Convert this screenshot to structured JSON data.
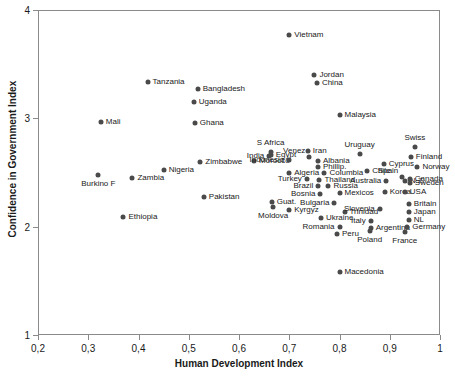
{
  "chart_data": {
    "type": "scatter",
    "title": "",
    "xlabel": "Human Development Index",
    "ylabel": "Confidence in Government Index",
    "xlim": [
      0.2,
      1.0
    ],
    "ylim": [
      1,
      4
    ],
    "xticks": [
      "0,2",
      "0,3",
      "0,4",
      "0,5",
      "0,6",
      "0,7",
      "0,8",
      "0,9",
      "1"
    ],
    "xtick_values": [
      0.2,
      0.3,
      0.4,
      0.5,
      0.6,
      0.7,
      0.8,
      0.9,
      1.0
    ],
    "yticks": [
      "1",
      "2",
      "3",
      "4"
    ],
    "ytick_values": [
      1,
      2,
      3,
      4
    ],
    "grid": false,
    "legend": "none",
    "marker_color": "#4a4a4a",
    "points": [
      {
        "label": "Vietnam",
        "x": 0.7,
        "y": 3.77,
        "side": "r"
      },
      {
        "label": "Jordan",
        "x": 0.75,
        "y": 3.4,
        "side": "r"
      },
      {
        "label": "China",
        "x": 0.755,
        "y": 3.33,
        "side": "r"
      },
      {
        "label": "Tanzania",
        "x": 0.418,
        "y": 3.34,
        "side": "r"
      },
      {
        "label": "Bangladesh",
        "x": 0.518,
        "y": 3.27,
        "side": "r"
      },
      {
        "label": "Uganda",
        "x": 0.51,
        "y": 3.15,
        "side": "r"
      },
      {
        "label": "Malaysia",
        "x": 0.8,
        "y": 3.03,
        "side": "r"
      },
      {
        "label": "Mali",
        "x": 0.325,
        "y": 2.97,
        "side": "r"
      },
      {
        "label": "Ghana",
        "x": 0.512,
        "y": 2.96,
        "side": "r"
      },
      {
        "label": "Swiss",
        "x": 0.95,
        "y": 2.74,
        "side": "c-up"
      },
      {
        "label": "S Africa",
        "x": 0.663,
        "y": 2.69,
        "side": "c-up"
      },
      {
        "label": "Iran",
        "x": 0.737,
        "y": 2.7,
        "side": "r"
      },
      {
        "label": "Uruguay",
        "x": 0.84,
        "y": 2.67,
        "side": "c-up"
      },
      {
        "label": "Egypt",
        "x": 0.663,
        "y": 2.66,
        "side": "r"
      },
      {
        "label": "India",
        "x": 0.66,
        "y": 2.65,
        "side": "l"
      },
      {
        "label": "Venez",
        "x": 0.74,
        "y": 2.64,
        "side": "l-up"
      },
      {
        "label": "Finland",
        "x": 0.942,
        "y": 2.64,
        "side": "r"
      },
      {
        "label": "Morocco",
        "x": 0.63,
        "y": 2.61,
        "side": "r"
      },
      {
        "label": "Indonesia",
        "x": 0.7,
        "y": 2.62,
        "side": "l"
      },
      {
        "label": "Albania",
        "x": 0.757,
        "y": 2.61,
        "side": "r"
      },
      {
        "label": "Zimbabwe",
        "x": 0.523,
        "y": 2.6,
        "side": "r"
      },
      {
        "label": "Cyprus",
        "x": 0.888,
        "y": 2.58,
        "side": "r"
      },
      {
        "label": "Phillip.",
        "x": 0.757,
        "y": 2.55,
        "side": "r"
      },
      {
        "label": "Norway",
        "x": 0.955,
        "y": 2.55,
        "side": "r"
      },
      {
        "label": "Nigeria",
        "x": 0.45,
        "y": 2.52,
        "side": "r"
      },
      {
        "label": "Algeria",
        "x": 0.7,
        "y": 2.5,
        "side": "r"
      },
      {
        "label": "Chile",
        "x": 0.855,
        "y": 2.51,
        "side": "r"
      },
      {
        "label": "Columbia",
        "x": 0.77,
        "y": 2.5,
        "side": "r"
      },
      {
        "label": "Burkino F",
        "x": 0.32,
        "y": 2.48,
        "side": "c-dn"
      },
      {
        "label": "Zambia",
        "x": 0.388,
        "y": 2.45,
        "side": "r"
      },
      {
        "label": "Spain",
        "x": 0.925,
        "y": 2.46,
        "side": "l-up"
      },
      {
        "label": "Turkey",
        "x": 0.735,
        "y": 2.44,
        "side": "l"
      },
      {
        "label": "Thailand",
        "x": 0.76,
        "y": 2.43,
        "side": "r"
      },
      {
        "label": "Australia",
        "x": 0.893,
        "y": 2.42,
        "side": "l"
      },
      {
        "label": "N.Z.",
        "x": 0.93,
        "y": 2.42,
        "side": "r"
      },
      {
        "label": "Canada",
        "x": 0.94,
        "y": 2.44,
        "side": "r"
      },
      {
        "label": "Sweden",
        "x": 0.94,
        "y": 2.4,
        "side": "r"
      },
      {
        "label": "Brazil",
        "x": 0.758,
        "y": 2.38,
        "side": "l"
      },
      {
        "label": "Russia",
        "x": 0.778,
        "y": 2.38,
        "side": "r"
      },
      {
        "label": "Mexicos",
        "x": 0.8,
        "y": 2.31,
        "side": "r"
      },
      {
        "label": "Korea",
        "x": 0.89,
        "y": 2.32,
        "side": "r"
      },
      {
        "label": "USA",
        "x": 0.93,
        "y": 2.32,
        "side": "r"
      },
      {
        "label": "Bosnia",
        "x": 0.762,
        "y": 2.3,
        "side": "l"
      },
      {
        "label": "Pakistan",
        "x": 0.53,
        "y": 2.27,
        "side": "r"
      },
      {
        "label": "Guat.",
        "x": 0.665,
        "y": 2.23,
        "side": "r"
      },
      {
        "label": "Bulgaria",
        "x": 0.79,
        "y": 2.22,
        "side": "l"
      },
      {
        "label": "Britain",
        "x": 0.938,
        "y": 2.21,
        "side": "r"
      },
      {
        "label": "Moldova",
        "x": 0.668,
        "y": 2.18,
        "side": "c-dn"
      },
      {
        "label": "Kyrgyz",
        "x": 0.7,
        "y": 2.15,
        "side": "r"
      },
      {
        "label": "Trinidad",
        "x": 0.81,
        "y": 2.14,
        "side": "r"
      },
      {
        "label": "Slovenia",
        "x": 0.88,
        "y": 2.16,
        "side": "l"
      },
      {
        "label": "Japan",
        "x": 0.938,
        "y": 2.14,
        "side": "r"
      },
      {
        "label": "Ethiopia",
        "x": 0.37,
        "y": 2.09,
        "side": "r"
      },
      {
        "label": "Ukraine",
        "x": 0.763,
        "y": 2.08,
        "side": "r"
      },
      {
        "label": "Italy",
        "x": 0.862,
        "y": 2.05,
        "side": "l"
      },
      {
        "label": "NL",
        "x": 0.938,
        "y": 2.06,
        "side": "r"
      },
      {
        "label": "Romania",
        "x": 0.8,
        "y": 2.0,
        "side": "l"
      },
      {
        "label": "Argentina",
        "x": 0.862,
        "y": 1.99,
        "side": "r"
      },
      {
        "label": "Germany",
        "x": 0.935,
        "y": 2.0,
        "side": "r"
      },
      {
        "label": "Peru",
        "x": 0.795,
        "y": 1.93,
        "side": "r"
      },
      {
        "label": "Poland",
        "x": 0.86,
        "y": 1.96,
        "side": "c-dn"
      },
      {
        "label": "France",
        "x": 0.93,
        "y": 1.95,
        "side": "c-dn"
      },
      {
        "label": "Macedonia",
        "x": 0.8,
        "y": 1.58,
        "side": "r"
      }
    ]
  }
}
